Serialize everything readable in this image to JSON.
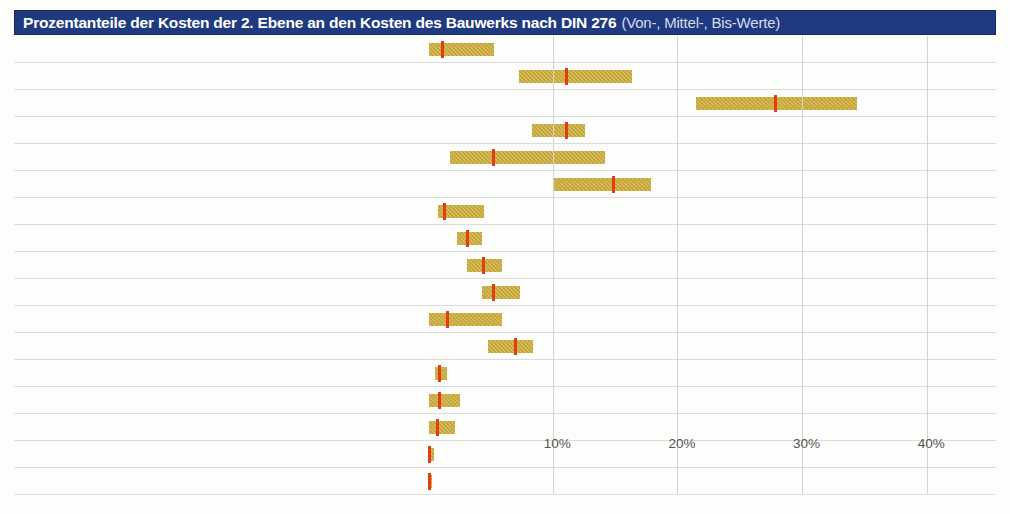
{
  "header": {
    "title_main": "Prozentanteile der Kosten der 2. Ebene an den Kosten des Bauwerks nach DIN 276",
    "title_sub": "(Von-, Mittel-, Bis-Werte)",
    "bg_color": "#1f3a80",
    "text_color": "#ffffff"
  },
  "colors": {
    "bar": "#c6a633",
    "mid_marker": "#e23c12",
    "grid": "#d2d2d2",
    "row_rule": "#dcdcdc",
    "text": "#3c3c3c"
  },
  "chart_data": {
    "type": "bar",
    "title": "Prozentanteile der Kosten der 2. Ebene an den Kosten des Bauwerks nach DIN 276",
    "subtitle": "(Von-, Mittel-, Bis-Werte)",
    "xlabel": "",
    "ylabel": "",
    "xlim": [
      0,
      44
    ],
    "xticks": [
      10,
      20,
      30,
      40
    ],
    "xticklabels": [
      "10%",
      "20%",
      "30%",
      "40%"
    ],
    "grid": true,
    "legend": "none",
    "value_columns": [
      "code",
      "label",
      "mittel"
    ],
    "series": [
      {
        "name": "von",
        "description": "left end of range bar"
      },
      {
        "name": "mittel",
        "description": "red marker, value column"
      },
      {
        "name": "bis",
        "description": "right end of range bar"
      }
    ],
    "rows": [
      {
        "code": "310",
        "label": "Baugrube",
        "mittel": "1,6",
        "von": 0.1,
        "mid": 1.1,
        "bis": 5.3
      },
      {
        "code": "320",
        "label": "Gründung",
        "mittel": "12,0",
        "von": 7.3,
        "mid": 11.1,
        "bis": 16.4
      },
      {
        "code": "330",
        "label": "Außenwände",
        "mittel": "27,6",
        "von": 21.5,
        "mid": 27.8,
        "bis": 34.4
      },
      {
        "code": "340",
        "label": "Innenwände",
        "mittel": "10,9",
        "von": 8.3,
        "mid": 11.1,
        "bis": 12.6
      },
      {
        "code": "350",
        "label": "Decken",
        "mittel": "6,3",
        "von": 1.8,
        "mid": 5.2,
        "bis": 14.2
      },
      {
        "code": "360",
        "label": "Dächer",
        "mittel": "14,7",
        "von": 10.1,
        "mid": 14.8,
        "bis": 17.9
      },
      {
        "code": "370",
        "label": "Baukonstruktive Einbauten",
        "mittel": "1,7",
        "von": 0.8,
        "mid": 1.3,
        "bis": 4.5
      },
      {
        "code": "390",
        "label": "Sonstige Baukonstruktionen",
        "mittel": "3,3",
        "von": 2.3,
        "mid": 3.1,
        "bis": 4.3
      },
      {
        "code": "410",
        "label": "Abwasser, Wasser, Gas",
        "mittel": "4,5",
        "von": 3.1,
        "mid": 4.4,
        "bis": 5.9
      },
      {
        "code": "420",
        "label": "Wärmeversorgungsanlagen",
        "mittel": "5,3",
        "von": 4.3,
        "mid": 5.2,
        "bis": 7.4
      },
      {
        "code": "430",
        "label": "Lufttechnische Anlagen",
        "mittel": "1,9",
        "von": 0.1,
        "mid": 1.5,
        "bis": 5.9
      },
      {
        "code": "440",
        "label": "Starkstromanlagen",
        "mittel": "7,2",
        "von": 4.8,
        "mid": 7.0,
        "bis": 8.4
      },
      {
        "code": "450",
        "label": "Fernmeldeanlagen",
        "mittel": "0,9",
        "von": 0.6,
        "mid": 0.9,
        "bis": 1.5
      },
      {
        "code": "460",
        "label": "Förderanlagen",
        "mittel": "1,1",
        "von": 0.1,
        "mid": 0.9,
        "bis": 2.6
      },
      {
        "code": "470",
        "label": "Nutzungsspezifische Anlagen",
        "mittel": "0,9",
        "von": 0.1,
        "mid": 0.7,
        "bis": 2.2
      },
      {
        "code": "480",
        "label": "Gebäudeautomation",
        "mittel": "0,1",
        "von": 0.0,
        "mid": 0.1,
        "bis": 0.5
      },
      {
        "code": "490",
        "label": "Sonstige Technische Anlagen",
        "mittel": "0,0",
        "von": 0.0,
        "mid": 0.05,
        "bis": 0.1
      }
    ]
  }
}
